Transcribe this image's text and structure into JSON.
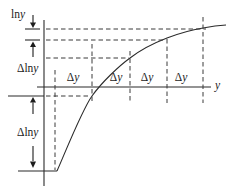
{
  "figure": {
    "type": "math-diagram",
    "properties": {
      "x_intervals_equal": "Δy",
      "y_intervals_decreasing": "Δln y",
      "curve_shape": "concave increasing (logarithmic)"
    },
    "colors": {
      "background": "#ffffff",
      "line": "#2b2b2b",
      "text": "#1c1c1c"
    }
  },
  "labels": {
    "vertical_axis": {
      "prefix": "ln",
      "variable": "y"
    },
    "delta_ln": {
      "prefix": "Δln",
      "variable": "y"
    },
    "delta_y": {
      "prefix": "Δ",
      "variable": "y"
    },
    "horizontal_axis": {
      "variable": "y"
    }
  }
}
